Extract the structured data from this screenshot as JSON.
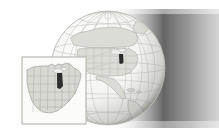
{
  "image": {
    "kind": "illustration",
    "subject": "globe-with-us-map-inset",
    "width": 219,
    "height": 137,
    "background_color": "#ffffff"
  },
  "globe": {
    "name": "earth-globe",
    "center_x": 108,
    "center_y": 68,
    "radius": 57,
    "sphere_fill": "#f2f2f1",
    "outline_color": "#b9b9b6",
    "graticule_color": "#c9c9c4",
    "landmass_label": "North America",
    "land_fill": "#dcdcd6",
    "land_outline": "#a9a9a3",
    "highlight_label": "Indiana",
    "highlight_fill": "#2b2b2b"
  },
  "shadow": {
    "name": "terminator-shadow",
    "dark_color": "#3a3a3a",
    "mid_color": "#8a8a8a",
    "light_color": "#ffffff",
    "top_band_height": 9,
    "bottom_band_top": 128
  },
  "inset": {
    "name": "us-map-inset",
    "x": 22,
    "y": 57,
    "width": 64,
    "height": 67,
    "border_color": "#bdbdb8",
    "panel_fill": "#fbfbfa",
    "map_fill": "#d9d9d3",
    "state_border_color": "#a6a6a0",
    "map_label": "United States",
    "highlight_label": "Indiana",
    "highlight_fill": "#2d2d2d",
    "leader_line_color": "#c4c4be"
  },
  "labels": {
    "alt_text": "Faded illustration of Earth showing North America with the state of Indiana highlighted, alongside an inset map of the United States with Indiana highlighted."
  }
}
